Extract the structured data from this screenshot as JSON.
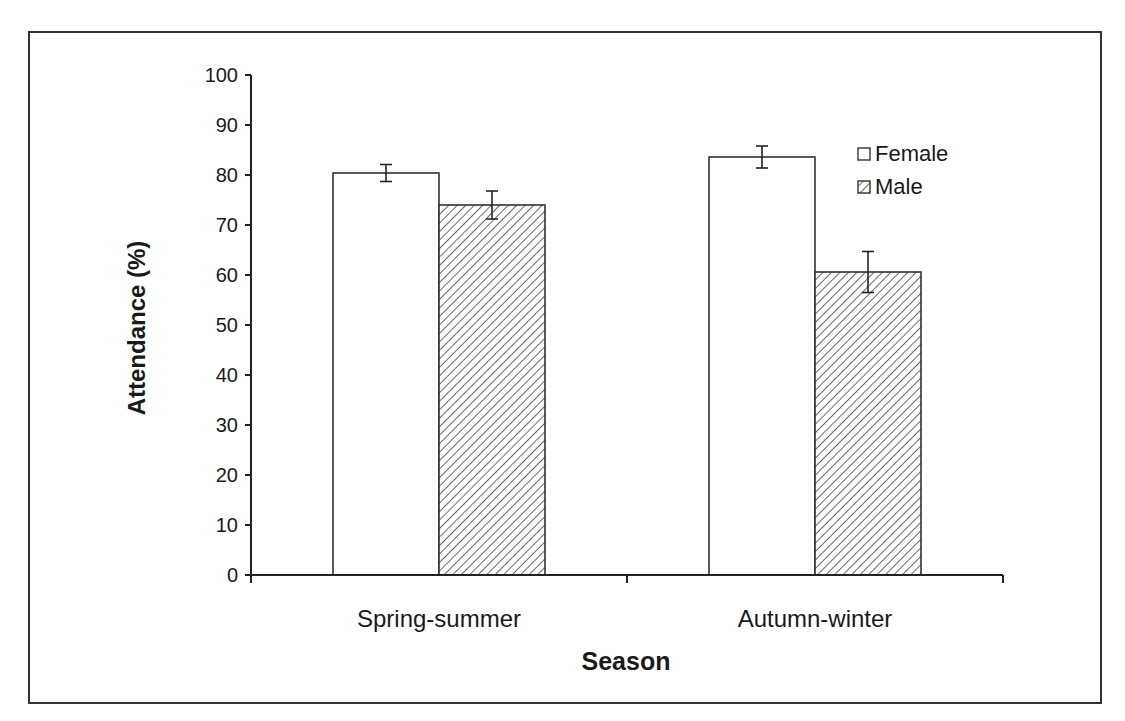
{
  "chart_data": {
    "type": "bar",
    "title": "",
    "xlabel": "Season",
    "ylabel": "Attendance (%)",
    "ylim": [
      0,
      100
    ],
    "yticks": [
      0,
      10,
      20,
      30,
      40,
      50,
      60,
      70,
      80,
      90,
      100
    ],
    "categories": [
      "Spring-summer",
      "Autumn-winter"
    ],
    "series": [
      {
        "name": "Female",
        "pattern": "solid-white",
        "values": [
          80.4,
          83.6
        ],
        "error": [
          1.7,
          2.2
        ]
      },
      {
        "name": "Male",
        "pattern": "diagonal-hatch",
        "values": [
          74.0,
          60.6
        ],
        "error": [
          2.8,
          4.1
        ]
      }
    ],
    "legend_position": "upper-right-inside",
    "grid": false
  }
}
